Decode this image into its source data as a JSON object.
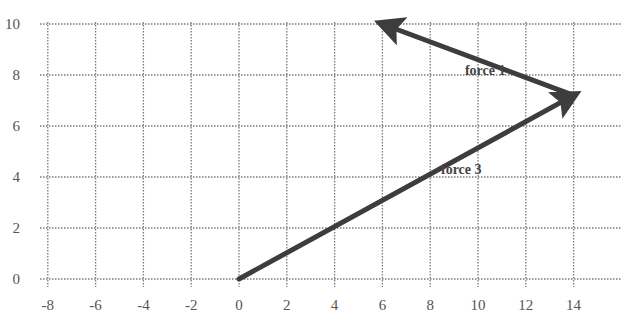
{
  "diagram": {
    "type": "vector-force-diagram",
    "axes": {
      "x_ticks": [
        -8,
        -6,
        -4,
        -2,
        0,
        2,
        4,
        6,
        8,
        10,
        12,
        14
      ],
      "y_ticks": [
        0,
        2,
        4,
        6,
        8,
        10
      ],
      "x_range": [
        -8,
        16
      ],
      "y_range": [
        0,
        10
      ]
    },
    "vectors": [
      {
        "name": "force 3",
        "label": "force 3",
        "from": [
          0,
          0
        ],
        "to": [
          14,
          7.2
        ],
        "label_pos": [
          9.3,
          4.1
        ]
      },
      {
        "name": "force 1",
        "label": "force 1",
        "from": [
          14,
          7.2
        ],
        "to": [
          6,
          10
        ],
        "label_pos": [
          10.3,
          8.0
        ]
      }
    ],
    "colors": {
      "vector": "#3d3d3d",
      "grid": "#7a7a7a",
      "tick_text": "#555555",
      "label_text": "#444444"
    }
  },
  "chart_data": {
    "type": "scatter",
    "title": "",
    "xlabel": "",
    "ylabel": "",
    "xlim": [
      -8,
      16
    ],
    "ylim": [
      0,
      10
    ],
    "grid": true,
    "series": [
      {
        "name": "force 3",
        "x": [
          0,
          14
        ],
        "y": [
          0,
          7.2
        ]
      },
      {
        "name": "force 1",
        "x": [
          14,
          6
        ],
        "y": [
          7.2,
          10
        ]
      }
    ],
    "annotations": [
      "force 1",
      "force 3"
    ]
  }
}
